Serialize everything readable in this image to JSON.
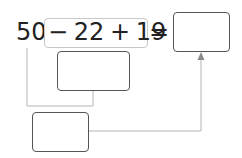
{
  "equation": {
    "start_value": "50",
    "grouped_expression": "− 22 + 19",
    "equals_sign": "="
  },
  "boxes": {
    "result_box": {
      "value": ""
    },
    "intermediate_box": {
      "value": ""
    },
    "final_step_box": {
      "value": ""
    }
  },
  "colors": {
    "text": "#222222",
    "box_border": "#555555",
    "group_border": "#c8c8c8",
    "connector": "#aaaaaa",
    "arrow": "#888888"
  }
}
